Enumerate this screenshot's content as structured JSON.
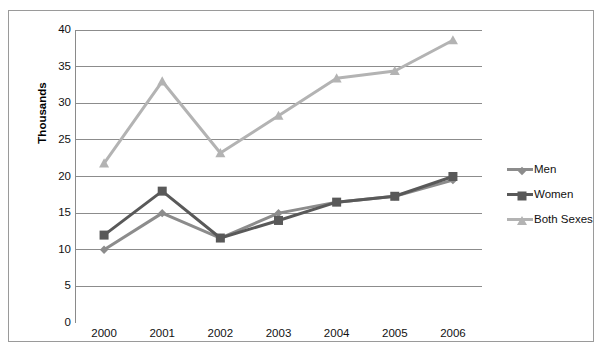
{
  "chart_data": {
    "type": "line",
    "title": "",
    "xlabel": "",
    "ylabel": "Thousands",
    "categories": [
      "2000",
      "2001",
      "2002",
      "2003",
      "2004",
      "2005",
      "2006"
    ],
    "ylim": [
      0,
      40
    ],
    "y_ticks": [
      0,
      5,
      10,
      15,
      20,
      25,
      30,
      35,
      40
    ],
    "y_tick_labels": [
      "0",
      "5",
      "10",
      "15",
      "20",
      "25",
      "30",
      "35",
      "40"
    ],
    "grid": true,
    "legend_position": "right",
    "series": [
      {
        "name": "Men",
        "color": "#8c8c8c",
        "marker": "diamond",
        "values": [
          10.0,
          15.0,
          11.6,
          15.0,
          16.5,
          17.3,
          19.5
        ]
      },
      {
        "name": "Women",
        "color": "#595959",
        "marker": "square",
        "values": [
          12.0,
          18.0,
          11.6,
          14.0,
          16.5,
          17.3,
          20.0
        ]
      },
      {
        "name": "Both Sexes",
        "color": "#b3b3b3",
        "marker": "triangle",
        "values": [
          21.8,
          33.0,
          23.2,
          28.3,
          33.4,
          34.4,
          38.6
        ]
      }
    ]
  },
  "colors": {
    "men": "#8c8c8c",
    "women": "#595959",
    "both_sexes": "#b3b3b3",
    "axis": "#8a8a8a",
    "grid": "#7f7f7f",
    "frame": "#9a9a9a",
    "text": "#111111"
  },
  "axis": {
    "y_title": "Thousands"
  },
  "legend": {
    "items": [
      {
        "label": "Men"
      },
      {
        "label": "Women"
      },
      {
        "label": "Both Sexes"
      }
    ]
  }
}
